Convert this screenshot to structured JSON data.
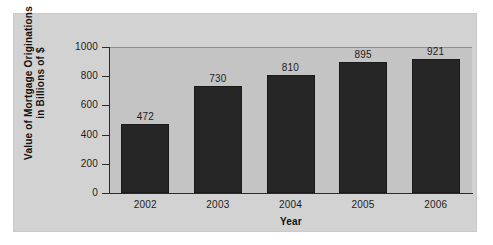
{
  "chart_data": {
    "type": "bar",
    "title": "",
    "xlabel": "Year",
    "ylabel_line1": "Value of Mortgage Originations",
    "ylabel_line2": "in Billions of $",
    "categories": [
      "2002",
      "2003",
      "2004",
      "2005",
      "2006"
    ],
    "values": [
      472,
      730,
      810,
      895,
      921
    ],
    "value_labels": [
      "472",
      "730",
      "810",
      "895",
      "921"
    ],
    "ylim": [
      0,
      1000
    ],
    "yticks": [
      0,
      200,
      400,
      600,
      800,
      1000
    ],
    "ytick_labels": [
      "0",
      "200",
      "400",
      "600",
      "800",
      "1000"
    ],
    "grid": false,
    "legend": "none",
    "bar_color": "#262626",
    "plot_background": "#c4c4c4",
    "panel_background": "#d2d2d2",
    "axis_color": "#2b2b2b",
    "text_color": "#1d1d1d"
  }
}
